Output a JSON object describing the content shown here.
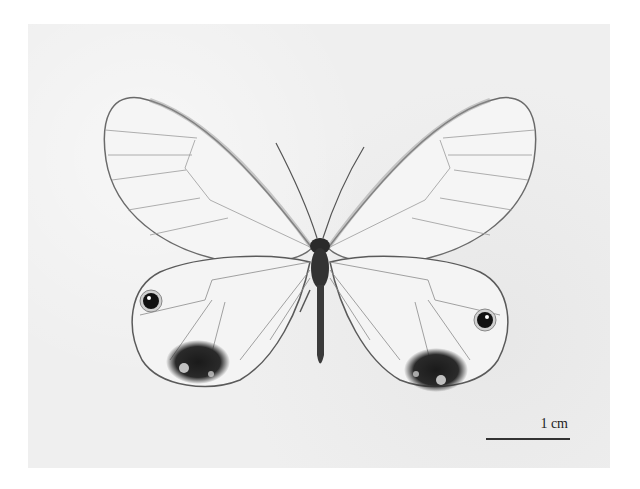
{
  "figure": {
    "scale_bar": {
      "label": "1 cm"
    },
    "colors": {
      "page_background": "#ffffff",
      "photo_background": "#efefef",
      "wing_fill": "#f4f4f4",
      "wing_edge": "#6a6a6a",
      "vein": "#8a8a8a",
      "body": "#2a2a2a",
      "eyespot": "#111111",
      "hindwing_patch": "#1e1e1e"
    }
  }
}
